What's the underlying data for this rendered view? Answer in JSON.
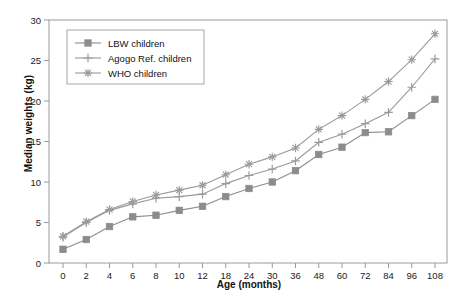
{
  "chart_data": {
    "type": "line",
    "title": "",
    "xlabel": "Age (months)",
    "ylabel": "Median weights (kg)",
    "categories": [
      0,
      2,
      4,
      6,
      8,
      10,
      12,
      18,
      24,
      30,
      36,
      48,
      60,
      72,
      84,
      96,
      108
    ],
    "xtick_labels": [
      "0",
      "2",
      "4",
      "6",
      "8",
      "10",
      "12",
      "18",
      "24",
      "30",
      "36",
      "48",
      "60",
      "72",
      "84",
      "96",
      "108"
    ],
    "ytick_labels": [
      "0",
      "5",
      "10",
      "15",
      "20",
      "25",
      "30"
    ],
    "yticks": [
      0,
      5,
      10,
      15,
      20,
      25,
      30
    ],
    "ylim": [
      0,
      30
    ],
    "grid": false,
    "legend_position": "upper-left",
    "axis_color": "#9a9a9a",
    "series": [
      {
        "name": "LBW children",
        "marker": "square",
        "color": "#8c8c8c",
        "values": [
          1.7,
          2.9,
          4.5,
          5.7,
          5.9,
          6.5,
          7.0,
          8.2,
          9.2,
          10.0,
          11.4,
          13.4,
          14.3,
          16.1,
          16.2,
          18.2,
          20.2
        ]
      },
      {
        "name": "Agogo Ref. children",
        "marker": "plus",
        "color": "#9a9a9a",
        "values": [
          3.2,
          5.0,
          6.5,
          7.3,
          8.0,
          8.2,
          8.5,
          9.8,
          10.8,
          11.6,
          12.6,
          14.9,
          15.9,
          17.2,
          18.6,
          21.7,
          25.2
        ]
      },
      {
        "name": "WHO children",
        "marker": "asterisk",
        "color": "#9a9a9a",
        "values": [
          3.3,
          5.1,
          6.6,
          7.6,
          8.4,
          9.0,
          9.6,
          10.9,
          12.2,
          13.1,
          14.2,
          16.5,
          18.2,
          20.2,
          22.4,
          25.1,
          28.3
        ]
      }
    ]
  }
}
